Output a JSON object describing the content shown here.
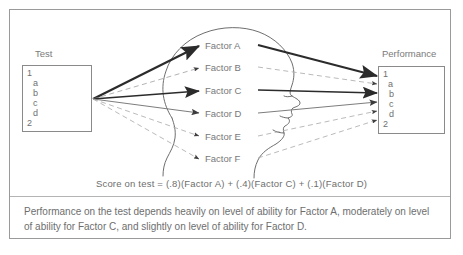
{
  "figure": {
    "left_label": "Test",
    "right_label": "Performance",
    "formula": "Score on test  =  (.8)(Factor A)  +  (.4)(Factor C)  +  (.1)(Factor D)",
    "caption": "Performance on the test depends heavily on level of ability for Factor A, moderately on level of ability for Factor C, and slightly on level of ability for Factor D."
  },
  "test_box": {
    "rows": [
      "1",
      "a",
      "b",
      "c",
      "d",
      "2"
    ]
  },
  "performance_box": {
    "rows": [
      "1",
      "a",
      "b",
      "c",
      "d",
      "2"
    ],
    "highlighted_row": "a"
  },
  "factors": [
    {
      "label": "Factor A",
      "weight": ".8",
      "link": "strong"
    },
    {
      "label": "Factor B",
      "weight": "",
      "link": "none"
    },
    {
      "label": "Factor C",
      "weight": ".4",
      "link": "moderate"
    },
    {
      "label": "Factor D",
      "weight": ".1",
      "link": "slight"
    },
    {
      "label": "Factor E",
      "weight": "",
      "link": "none"
    },
    {
      "label": "Factor F",
      "weight": "",
      "link": "none"
    }
  ],
  "colors": {
    "frame": "#9a9a9a",
    "text": "#6e6e6e",
    "strong_line": "#2b2b2b",
    "light_line": "#8d8d8d",
    "dashed_line": "#a8a8a8",
    "head_outline": "#5d5d5d"
  }
}
